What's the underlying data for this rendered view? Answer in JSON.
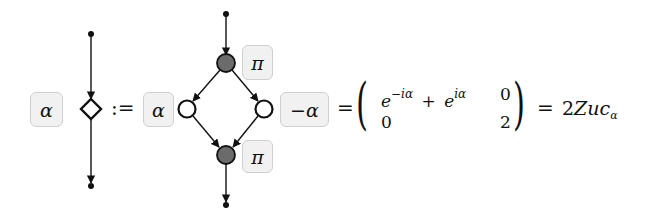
{
  "diagram": {
    "lhs": {
      "phase_label": "α",
      "node_shape": "diamond",
      "define_symbol": ":="
    },
    "rhs_graph": {
      "left_label": "α",
      "right_label": "−α",
      "top_node_label": "π",
      "bottom_node_label": "π",
      "top_node_fill": "#6b6b6b",
      "bottom_node_fill": "#6b6b6b",
      "side_node_fill": "#ffffff"
    },
    "equation": {
      "equals_1": "=",
      "matrix": {
        "r1c1_base": "e",
        "r1c1_exp1": "−iα",
        "r1c1_plus": "+",
        "r1c1_base2": "e",
        "r1c1_exp2": "iα",
        "r1c2": "0",
        "r2c1": "0",
        "r2c2": "2"
      },
      "equals_2": "=",
      "result_coeff": "2",
      "result_main": "Zuc",
      "result_sub": "α"
    },
    "colors": {
      "label_bg": "#f1f1f1",
      "label_border": "#cfcfcf",
      "stroke": "#111111",
      "gray_node": "#6b6b6b"
    }
  }
}
